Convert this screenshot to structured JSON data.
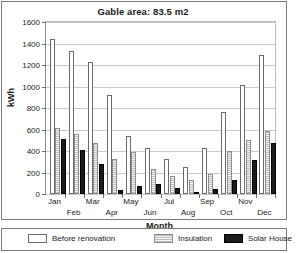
{
  "chart_data": {
    "type": "bar",
    "title": "Gable area: 83.5 m2",
    "xlabel": "Month",
    "ylabel": "kWh",
    "ylim": [
      0,
      1600
    ],
    "ytick_step": 200,
    "yticks": [
      1600,
      1400,
      1200,
      1000,
      800,
      600,
      400,
      200,
      0
    ],
    "grid": true,
    "legend_position": "bottom",
    "categories": [
      "Jan",
      "Feb",
      "Mar",
      "Apr",
      "May",
      "Jun",
      "Jul",
      "Aug",
      "Sep",
      "Oct",
      "Nov",
      "Dec"
    ],
    "series": [
      {
        "name": "Before renovation",
        "color": "#ffffff",
        "values": [
          1440,
          1330,
          1230,
          920,
          540,
          430,
          330,
          250,
          430,
          760,
          1010,
          1290
        ]
      },
      {
        "name": "Insulation",
        "color": "#f2f2f2",
        "values": [
          610,
          560,
          470,
          330,
          390,
          230,
          170,
          130,
          190,
          400,
          500,
          590
        ]
      },
      {
        "name": "Solar House",
        "color": "#1b1b1b",
        "values": [
          510,
          410,
          280,
          40,
          70,
          90,
          60,
          20,
          50,
          130,
          320,
          470
        ]
      }
    ]
  },
  "legend": {
    "entries": [
      {
        "label": "Before renovation",
        "style": "before"
      },
      {
        "label": "Insulation",
        "style": "insulation"
      },
      {
        "label": "Solar House",
        "style": "solar"
      }
    ]
  }
}
